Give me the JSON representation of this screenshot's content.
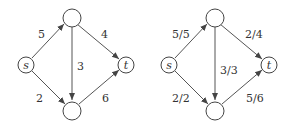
{
  "graphs": [
    {
      "name": "capacities",
      "nodes": {
        "s": "s",
        "t": "t",
        "top": "",
        "bottom": ""
      },
      "edges": {
        "s_top": "5",
        "top_t": "4",
        "top_bottom": "3",
        "s_bottom": "2",
        "bottom_t": "6"
      }
    },
    {
      "name": "flow",
      "nodes": {
        "s": "s",
        "t": "t",
        "top": "",
        "bottom": ""
      },
      "edges": {
        "s_top": "5/5",
        "top_t": "2/4",
        "top_bottom": "3/3",
        "s_bottom": "2/2",
        "bottom_t": "5/6"
      }
    }
  ]
}
